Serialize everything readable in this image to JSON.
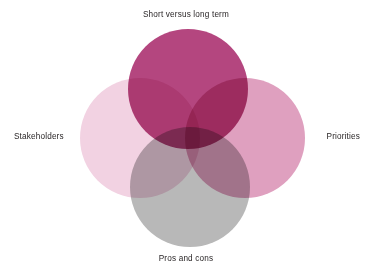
{
  "diagram": {
    "type": "venn",
    "background_color": "#ffffff",
    "label_color": "#231f20",
    "blend_mode": "multiply",
    "sets": [
      {
        "id": "short-versus-long-term",
        "label": "Short versus long term",
        "position": "top",
        "color": "#b4467f",
        "cx": 188,
        "cy": 89,
        "r": 60
      },
      {
        "id": "stakeholders",
        "label": "Stakeholders",
        "position": "left",
        "color": "#f2d2e2",
        "cx": 140,
        "cy": 138,
        "r": 60
      },
      {
        "id": "priorities",
        "label": "Priorities",
        "position": "right",
        "color": "#dfa0bf",
        "cx": 245,
        "cy": 138,
        "r": 60
      },
      {
        "id": "pros-and-cons",
        "label": "Pros and cons",
        "position": "bottom",
        "color": "#b8b8b8",
        "cx": 190,
        "cy": 187,
        "r": 60
      }
    ],
    "overlap_colors": {
      "top_left": "#a83a72",
      "top_right": "#a8327a",
      "left_bottom": "#a08a9a",
      "right_bottom": "#8a6278",
      "center_all": "#6e1a48"
    }
  }
}
